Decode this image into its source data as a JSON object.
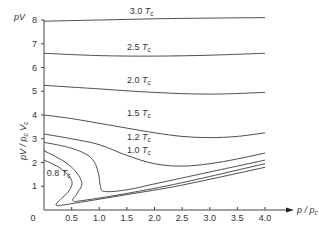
{
  "chart_data": {
    "type": "line",
    "title": "",
    "xlabel": "p / p_c",
    "ylabel": "pV / p_c V_c",
    "top_axis_label": "pV",
    "xlim": [
      0,
      4.3
    ],
    "ylim": [
      0,
      8
    ],
    "xticks": [
      0.5,
      1.0,
      1.5,
      2.0,
      2.5,
      3.0,
      3.5,
      4.0
    ],
    "xtick_labels": [
      "0.5",
      "1.0",
      "1.5",
      "2.0",
      "2.5",
      "3.0",
      "3.5",
      "4.0"
    ],
    "yticks": [
      1,
      2,
      3,
      4,
      5,
      6,
      7,
      8
    ],
    "ytick_labels": [
      "1",
      "2",
      "3",
      "4",
      "5",
      "6",
      "7",
      "8"
    ],
    "origin_label": "0",
    "grid": false,
    "legend": "inline labels on curves",
    "series": [
      {
        "name": "3.0 T_c",
        "label_text": "3.0",
        "label_pos": [
          1.55,
          8.25
        ],
        "points": [
          [
            0,
            7.95
          ],
          [
            1.0,
            8.0
          ],
          [
            2.0,
            8.05
          ],
          [
            3.0,
            8.08
          ],
          [
            4.0,
            8.1
          ]
        ]
      },
      {
        "name": "2.5 T_c",
        "label_text": "2.5",
        "label_pos": [
          1.5,
          6.75
        ],
        "points": [
          [
            0,
            6.6
          ],
          [
            1.0,
            6.5
          ],
          [
            2.0,
            6.48
          ],
          [
            3.0,
            6.52
          ],
          [
            4.0,
            6.6
          ]
        ]
      },
      {
        "name": "2.0 T_c",
        "label_text": "2.0",
        "label_pos": [
          1.5,
          5.35
        ],
        "points": [
          [
            0,
            5.25
          ],
          [
            1.0,
            5.1
          ],
          [
            2.0,
            4.95
          ],
          [
            3.0,
            4.88
          ],
          [
            4.0,
            4.95
          ]
        ]
      },
      {
        "name": "1.5 T_c",
        "label_text": "1.5",
        "label_pos": [
          1.5,
          3.95
        ],
        "points": [
          [
            0,
            4.0
          ],
          [
            0.5,
            3.85
          ],
          [
            1.0,
            3.65
          ],
          [
            1.5,
            3.45
          ],
          [
            2.0,
            3.25
          ],
          [
            2.5,
            3.1
          ],
          [
            3.0,
            3.05
          ],
          [
            3.5,
            3.1
          ],
          [
            4.0,
            3.25
          ]
        ]
      },
      {
        "name": "1.2 T_c",
        "label_text": "1.2",
        "label_pos": [
          1.5,
          2.95
        ],
        "points": [
          [
            0,
            3.2
          ],
          [
            0.5,
            3.0
          ],
          [
            1.0,
            2.75
          ],
          [
            1.5,
            2.3
          ],
          [
            2.0,
            1.95
          ],
          [
            2.5,
            1.85
          ],
          [
            3.0,
            1.95
          ],
          [
            3.5,
            2.15
          ],
          [
            4.0,
            2.4
          ]
        ]
      },
      {
        "name": "1.0 T_c",
        "label_text": "1.0",
        "label_pos": [
          1.5,
          2.4
        ],
        "points": [
          [
            0,
            2.85
          ],
          [
            0.5,
            2.6
          ],
          [
            0.85,
            2.2
          ],
          [
            0.98,
            1.6
          ],
          [
            1.02,
            1.0
          ],
          [
            1.1,
            0.78
          ],
          [
            1.5,
            0.85
          ],
          [
            2.0,
            1.1
          ],
          [
            3.0,
            1.6
          ],
          [
            4.0,
            2.1
          ]
        ]
      },
      {
        "name": "T_c curve 2 (unlabeled)",
        "points": [
          [
            0,
            2.5
          ],
          [
            0.45,
            1.9
          ],
          [
            0.68,
            1.2
          ],
          [
            0.6,
            0.7
          ],
          [
            0.52,
            0.4
          ],
          [
            0.7,
            0.4
          ],
          [
            1.5,
            0.7
          ],
          [
            2.5,
            1.15
          ],
          [
            4.0,
            1.95
          ]
        ]
      },
      {
        "name": "0.8 T_c",
        "label_text": "0.8",
        "label_pos": [
          0.05,
          1.45
        ],
        "points": [
          [
            0,
            2.1
          ],
          [
            0.3,
            1.75
          ],
          [
            0.5,
            1.25
          ],
          [
            0.45,
            0.8
          ],
          [
            0.3,
            0.45
          ],
          [
            0.22,
            0.2
          ],
          [
            0.45,
            0.25
          ],
          [
            1.5,
            0.65
          ],
          [
            2.5,
            1.05
          ],
          [
            4.0,
            1.8
          ]
        ]
      }
    ],
    "temperature_unit": "T_c"
  }
}
